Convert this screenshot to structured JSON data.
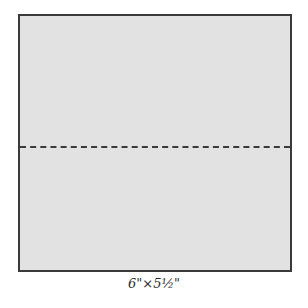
{
  "diagram": {
    "shape": "rectangle",
    "fill_color": "#e2e2e2",
    "border_color": "#3a3a3a",
    "fold_line": {
      "style": "dashed",
      "orientation": "horizontal",
      "position": "middle"
    },
    "caption": "6\"×5½\""
  }
}
